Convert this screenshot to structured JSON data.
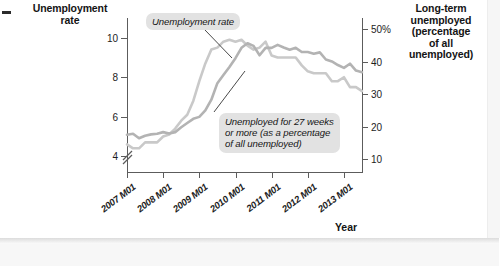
{
  "titles": {
    "left_axis": "Unemployment\nrate",
    "right_axis": "Long-term\nunemployed\n(percentage\nof all\nunemployed)",
    "x_axis": "Year"
  },
  "callouts": {
    "unemployment_rate": "Unemployment rate",
    "long_term": "Unemployed for 27 weeks\nor more (as a percentage\nof all unemployed)"
  },
  "chart_data": {
    "type": "line",
    "title": "",
    "xlabel": "Year",
    "ylabel": "Unemployment rate",
    "y2label": "Long-term unemployed (percentage of all unemployed)",
    "grid": false,
    "legend": "annotations",
    "axis_break": true,
    "xlim": [
      "2007 M01",
      "2013 M07"
    ],
    "ylim": [
      3.2,
      11.0
    ],
    "y2lim": [
      6.0,
      53.5
    ],
    "xticks": [
      "2007 M01",
      "2008 M01",
      "2009 M01",
      "2010 M01",
      "2011 M01",
      "2012 M01",
      "2013 M01"
    ],
    "yticks": [
      4,
      6,
      8,
      10
    ],
    "ytick_labels": [
      "4",
      "6",
      "8",
      "10"
    ],
    "y2ticks": [
      10,
      20,
      30,
      40,
      50
    ],
    "y2tick_labels": [
      "10",
      "20",
      "30",
      "40",
      "50%"
    ],
    "series": [
      {
        "name": "Unemployment rate",
        "axis": "left",
        "color": "#c9c9c9",
        "x": [
          "2007 M01",
          "2007 M03",
          "2007 M05",
          "2007 M07",
          "2007 M09",
          "2007 M11",
          "2008 M01",
          "2008 M03",
          "2008 M05",
          "2008 M07",
          "2008 M09",
          "2008 M11",
          "2009 M01",
          "2009 M03",
          "2009 M05",
          "2009 M07",
          "2009 M09",
          "2009 M11",
          "2010 M01",
          "2010 M03",
          "2010 M05",
          "2010 M07",
          "2010 M09",
          "2010 M11",
          "2011 M01",
          "2011 M03",
          "2011 M05",
          "2011 M07",
          "2011 M09",
          "2011 M11",
          "2012 M01",
          "2012 M03",
          "2012 M05",
          "2012 M07",
          "2012 M09",
          "2012 M11",
          "2013 M01",
          "2013 M03",
          "2013 M05",
          "2013 M07"
        ],
        "values": [
          4.6,
          4.4,
          4.4,
          4.7,
          4.7,
          4.7,
          5.0,
          5.1,
          5.4,
          5.8,
          6.1,
          6.8,
          7.8,
          8.7,
          9.4,
          9.5,
          9.8,
          9.9,
          9.8,
          9.9,
          9.6,
          9.4,
          9.5,
          9.8,
          9.1,
          9.0,
          9.0,
          9.0,
          9.0,
          8.6,
          8.3,
          8.2,
          8.2,
          8.2,
          7.8,
          7.8,
          8.0,
          7.5,
          7.5,
          7.3
        ]
      },
      {
        "name": "Unemployed for 27 weeks or more (as a percentage of all unemployed)",
        "axis": "right",
        "color": "#b3b3b3",
        "x": [
          "2007 M01",
          "2007 M03",
          "2007 M05",
          "2007 M07",
          "2007 M09",
          "2007 M11",
          "2008 M01",
          "2008 M03",
          "2008 M05",
          "2008 M07",
          "2008 M09",
          "2008 M11",
          "2009 M01",
          "2009 M03",
          "2009 M05",
          "2009 M07",
          "2009 M09",
          "2009 M11",
          "2010 M01",
          "2010 M03",
          "2010 M05",
          "2010 M07",
          "2010 M09",
          "2010 M11",
          "2011 M01",
          "2011 M03",
          "2011 M05",
          "2011 M07",
          "2011 M09",
          "2011 M11",
          "2012 M01",
          "2012 M03",
          "2012 M05",
          "2012 M07",
          "2012 M09",
          "2012 M11",
          "2013 M01",
          "2013 M03",
          "2013 M05",
          "2013 M07"
        ],
        "values": [
          17.5,
          17.8,
          16.4,
          17.2,
          17.6,
          17.8,
          18.3,
          17.9,
          18.3,
          19.8,
          21.1,
          22.4,
          23.0,
          25.0,
          28.3,
          33.4,
          35.9,
          38.4,
          41.1,
          44.3,
          45.7,
          44.9,
          42.0,
          44.3,
          44.3,
          45.2,
          44.4,
          43.7,
          44.3,
          43.0,
          43.0,
          42.5,
          42.9,
          40.7,
          40.1,
          39.0,
          38.1,
          39.4,
          37.3,
          36.8
        ]
      }
    ],
    "annotations": [
      {
        "text": "Unemployment rate",
        "points_to_series": "Unemployment rate",
        "points_to_x": "2009 M09"
      },
      {
        "text": "Unemployed for 27 weeks or more (as a percentage of all unemployed)",
        "points_to_series": "Unemployed for 27 weeks or more (as a percentage of all unemployed)",
        "points_to_x": "2010 M03"
      }
    ]
  }
}
